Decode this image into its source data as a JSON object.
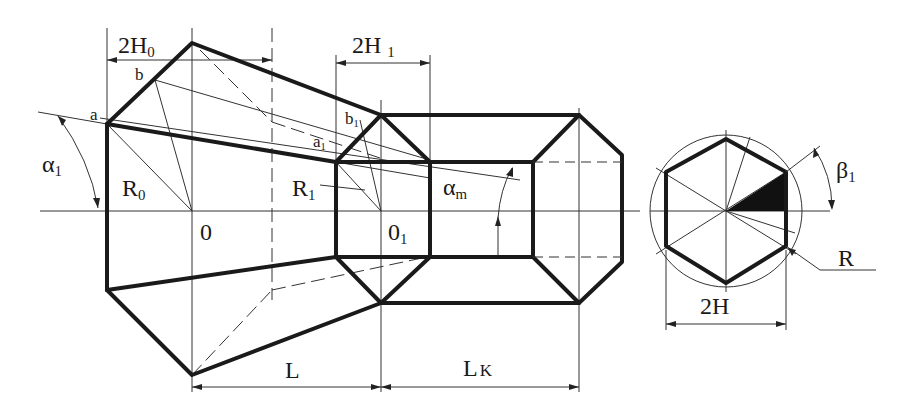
{
  "diagram": {
    "type": "technical-drawing",
    "labels": {
      "dim_2H0": "2H",
      "dim_2H0_sub": "0",
      "dim_2H1": "2H",
      "dim_2H1_sub": "1",
      "point_a": "a",
      "point_b": "b",
      "point_a1": "a",
      "point_a1_sub": "1",
      "point_b1": "b",
      "point_b1_sub": "1",
      "angle_alpha1": "α",
      "angle_alpha1_sub": "1",
      "radius_R0": "R",
      "radius_R0_sub": "0",
      "radius_R1": "R",
      "radius_R1_sub": "1",
      "center_0": "0",
      "center_01": "0",
      "center_01_sub": "1",
      "angle_alpham": "α",
      "angle_alpham_sub": "m",
      "dim_L": "L",
      "dim_Lk": "L",
      "dim_Lk_sub": "K",
      "angle_beta1": "β",
      "angle_beta1_sub": "1",
      "radius_R": "R",
      "dim_2H": "2H"
    },
    "colors": {
      "line": "#1a1a1a",
      "background": "#ffffff",
      "fill_sector": "#111111"
    }
  }
}
